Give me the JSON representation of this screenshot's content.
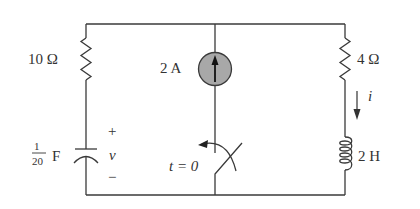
{
  "diagram": {
    "type": "circuit",
    "components": {
      "resistor_left": {
        "label": "10 Ω"
      },
      "current_source": {
        "label": "2 A",
        "direction": "up",
        "fill": "#a8a8a8"
      },
      "resistor_right": {
        "label": "4 Ω"
      },
      "capacitor": {
        "label_num": "1",
        "label_den": "20",
        "label_unit": "F",
        "voltage_label": "v",
        "plus": "+",
        "minus": "−"
      },
      "switch": {
        "label": "t = 0"
      },
      "inductor": {
        "label": "2 H"
      },
      "current_arrow": {
        "label": "i"
      }
    }
  }
}
